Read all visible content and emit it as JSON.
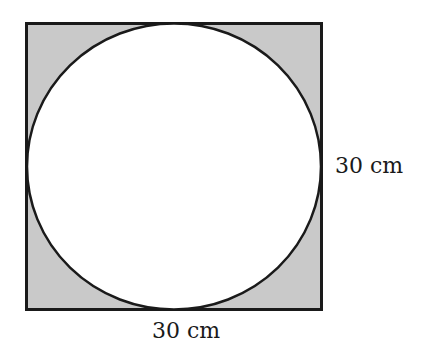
{
  "diagram": {
    "title": "",
    "shape": "circle inscribed in square",
    "square": {
      "side_label_right": "30 cm",
      "side_label_bottom": "30 cm"
    },
    "colors": {
      "shaded_region": "#c9c9c9",
      "circle_fill": "#ffffff",
      "stroke": "#1a1a1a"
    }
  }
}
